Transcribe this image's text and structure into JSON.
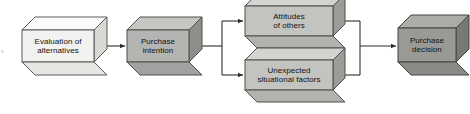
{
  "diagram": {
    "type": "process-flow",
    "edge_artifact": "s",
    "nodes": [
      {
        "id": "evaluation-of-alternatives",
        "label_line1": "Evaluation of",
        "label_line2": "alternatives",
        "fill": "#f2f2f0",
        "top_face_fill": "#fbfbfa",
        "side_face_fill": "#d8d8d4",
        "bottom_face_fill": "#e6e6e2",
        "stroke": "#5a5a58",
        "x": 22,
        "y": 30,
        "width": 72,
        "height": 32,
        "depth": 13
      },
      {
        "id": "purchase-intention",
        "label_line1": "Purchase",
        "label_line2": "intention",
        "fill": "#b4b4b2",
        "top_face_fill": "#c6c6c3",
        "side_face_fill": "#8e8e8b",
        "bottom_face_fill": "#a2a2a0",
        "stroke": "#4f4f4d",
        "x": 127,
        "y": 30,
        "width": 62,
        "height": 32,
        "depth": 13
      },
      {
        "id": "attitudes-of-others",
        "label_line1": "Attitudes",
        "label_line2": "of others",
        "fill": "#c3c3c0",
        "top_face_fill": "#d3d3d0",
        "side_face_fill": "#9c9c99",
        "bottom_face_fill": "#b2b2af",
        "stroke": "#4f4f4d",
        "x": 245,
        "y": 6,
        "width": 88,
        "height": 30,
        "depth": 12
      },
      {
        "id": "unexpected-situational-factors",
        "label_line1": "Unexpected",
        "label_line2": "situational factors",
        "fill": "#c3c3c0",
        "top_face_fill": "#d3d3d0",
        "side_face_fill": "#9c9c99",
        "bottom_face_fill": "#b2b2af",
        "stroke": "#4f4f4d",
        "x": 245,
        "y": 60,
        "width": 88,
        "height": 30,
        "depth": 12
      },
      {
        "id": "purchase-decision",
        "label_line1": "Purchase",
        "label_line2": "decision",
        "fill": "#999996",
        "top_face_fill": "#ababa8",
        "side_face_fill": "#787875",
        "bottom_face_fill": "#8a8a87",
        "stroke": "#454543",
        "x": 398,
        "y": 28,
        "width": 58,
        "height": 34,
        "depth": 13
      }
    ],
    "connectors": [
      {
        "id": "evaluation-to-intention",
        "from": "evaluation-of-alternatives",
        "to": "purchase-intention",
        "arrow": true
      },
      {
        "id": "intention-to-branch",
        "from": "purchase-intention",
        "to": "branch-split",
        "arrow": false
      },
      {
        "id": "branch-to-attitudes",
        "from": "branch-split",
        "to": "attitudes-of-others",
        "arrow": true
      },
      {
        "id": "branch-to-unexpected",
        "from": "branch-split",
        "to": "unexpected-situational-factors",
        "arrow": true
      },
      {
        "id": "attitudes-to-merge",
        "from": "attitudes-of-others",
        "to": "merge-join",
        "arrow": false
      },
      {
        "id": "unexpected-to-merge",
        "from": "unexpected-situational-factors",
        "to": "merge-join",
        "arrow": false
      },
      {
        "id": "merge-to-decision",
        "from": "merge-join",
        "to": "purchase-decision",
        "arrow": true
      }
    ],
    "line_color": "#2e2e2e"
  }
}
